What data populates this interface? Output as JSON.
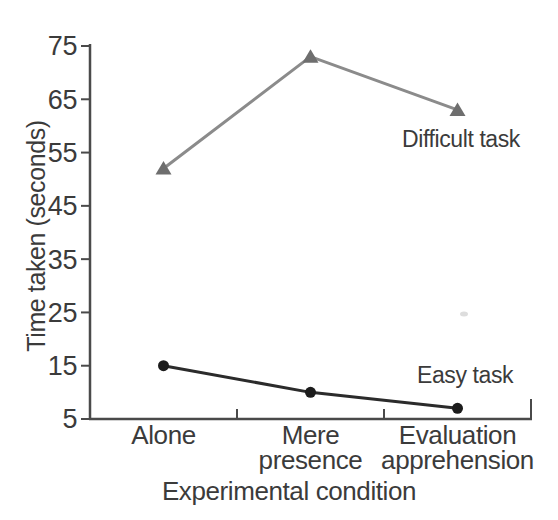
{
  "chart_data": {
    "type": "line",
    "title": "",
    "xlabel": "Experimental condition",
    "ylabel": "Time taken (seconds)",
    "categories": [
      "Alone",
      "Mere presence",
      "Evaluation apprehension"
    ],
    "series": [
      {
        "name": "Difficult task",
        "values": [
          52,
          73,
          63
        ],
        "color": "#8b8b8b",
        "marker": "triangle",
        "marker_color": "#6e6e6e"
      },
      {
        "name": "Easy task",
        "values": [
          15,
          10,
          7
        ],
        "color": "#2b2b2b",
        "marker": "circle",
        "marker_color": "#1c1c1c"
      }
    ],
    "ylim": [
      5,
      75
    ],
    "yticks": [
      75,
      65,
      55,
      45,
      35,
      25,
      15,
      5
    ],
    "grid": false,
    "legend_position": "inline-annotations",
    "axis_color": "#4a4a4a",
    "text_color": "#3b3b3b",
    "background_color": "#ffffff"
  }
}
